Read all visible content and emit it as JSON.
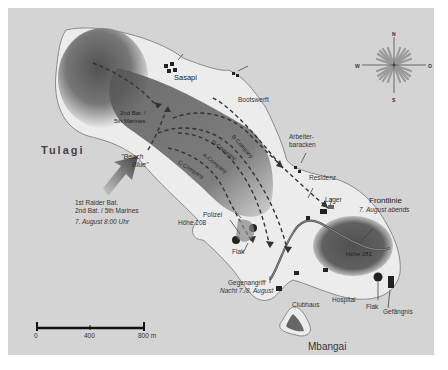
{
  "map": {
    "colors": {
      "sea": "#d4d4d4",
      "land_light": "#ececec",
      "land_dark": "#555555",
      "coast": "#8a8a8a",
      "frontline": "#4a4a4a",
      "text": "#333333"
    },
    "islands": {
      "tulagi": "Tulagi",
      "mbangai": "Mbangai"
    },
    "places": {
      "sasapi": "Sasapi",
      "bootswerft": "Bootswerft",
      "arbeiter_1": "Arbeiter-",
      "arbeiter_2": "baracken",
      "residenz": "Residenz",
      "lager": "Lager",
      "polizei": "Polizei",
      "hoehe_208": "Höhe 208",
      "hoehe_281": "Höhe 281",
      "flak_west": "Flak",
      "flak_east": "Flak",
      "clubhaus": "Clubhaus",
      "hospital": "Hospital",
      "gefaengnis": "Gefängnis"
    },
    "units": {
      "bat_2_line1": "2nd Bat. /",
      "bat_2_line2": "5th Marines",
      "b_company": "B-Company",
      "d_company": "D-Company",
      "a_company": "A-Company",
      "c_company": "C-Company"
    },
    "landing": {
      "beach_1": "\"Beach",
      "beach_2": "Blue\"",
      "force_1": "1st Raider Bat.",
      "force_2": "2nd Bat. / 5th Marines",
      "time": "7. August  8:00 Uhr"
    },
    "events": {
      "frontline_1": "Frontlinie",
      "frontline_2": "7. August abends",
      "counterattack_1": "Gegenangriff",
      "counterattack_2": "Nacht 7./8. August"
    },
    "compass": {
      "n": "N",
      "s": "S",
      "w": "W",
      "o": "O"
    },
    "scale": {
      "tick_0": "0",
      "tick_400": "400",
      "tick_800": "800 m"
    }
  }
}
